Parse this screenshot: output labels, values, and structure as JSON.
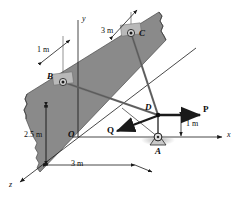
{
  "figure": {
    "type": "engineering-statics-free-body-diagram",
    "background_color": "#ffffff",
    "plate_fill": "#8a8a8a",
    "plate_stroke": "#4a4a4a",
    "line_color": "#1a1a1a",
    "rod_color": "#6f6f6f"
  },
  "axes": [
    {
      "id": "y",
      "label": "y",
      "orientation": "vertical-up"
    },
    {
      "id": "x",
      "label": "x",
      "orientation": "horizontal-right"
    },
    {
      "id": "z",
      "label": "z",
      "orientation": "diagonal-down-left"
    }
  ],
  "points": [
    {
      "id": "O",
      "label": "O",
      "role": "origin"
    },
    {
      "id": "A",
      "label": "A",
      "role": "ball-and-socket-support"
    },
    {
      "id": "B",
      "label": "B",
      "role": "bearing-support"
    },
    {
      "id": "C",
      "label": "C",
      "role": "bearing-support"
    },
    {
      "id": "D",
      "label": "D",
      "role": "load-application-point"
    }
  ],
  "forces": [
    {
      "id": "P",
      "label": "P",
      "direction": "positive-x"
    },
    {
      "id": "Q",
      "label": "Q",
      "direction": "negative-x-down-left"
    }
  ],
  "dimensions": [
    {
      "id": "d1",
      "label": "1 m",
      "between": "y-axis-to-B-line"
    },
    {
      "id": "d2",
      "label": "3 m",
      "between": "y-axis-to-C-line"
    },
    {
      "id": "d3",
      "label": "2.5 m",
      "between": "plate-top-edge-to-bottom-edge"
    },
    {
      "id": "d4",
      "label": "3 m",
      "between": "plate-left-edge-to-A"
    },
    {
      "id": "d5",
      "label": "1 m",
      "between": "D-to-A-vertical"
    }
  ]
}
